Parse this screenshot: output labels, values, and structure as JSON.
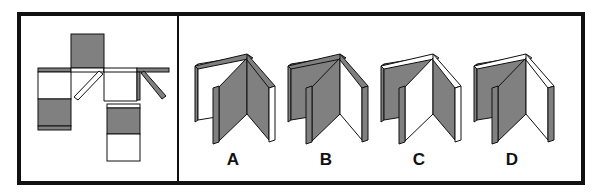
{
  "puzzle": {
    "type": "net folding (cube/book) spatial reasoning",
    "net_panel": {
      "description": "unfolded net with shaded (gray) and white faces, including two diagonal flaps"
    },
    "options": [
      {
        "label": "A"
      },
      {
        "label": "B"
      },
      {
        "label": "C"
      },
      {
        "label": "D"
      }
    ]
  },
  "colors": {
    "shade": "#808080",
    "outline": "#111111",
    "white": "#ffffff"
  }
}
